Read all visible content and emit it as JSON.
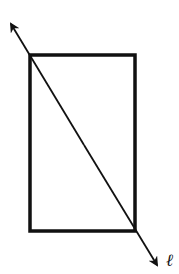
{
  "diagram": {
    "line_label": "ℓ",
    "stroke_color": "#111111",
    "background": "#ffffff"
  }
}
